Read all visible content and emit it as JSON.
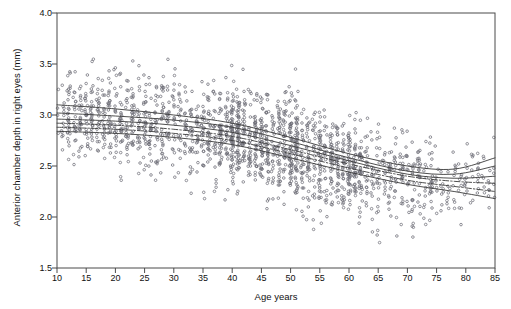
{
  "chart_data": {
    "type": "scatter",
    "title": "",
    "xlabel": "Age years",
    "ylabel": "Anterior chamber depth in right eyes (mm)",
    "xlim": [
      10,
      85
    ],
    "ylim": [
      1.5,
      4.0
    ],
    "xticks": [
      10,
      15,
      20,
      25,
      30,
      35,
      40,
      45,
      50,
      55,
      60,
      65,
      70,
      75,
      80,
      85
    ],
    "xtick_labels": [
      "10",
      "15",
      "20",
      "25",
      "30",
      "35",
      "40",
      "45",
      "50",
      "55",
      "60",
      "65",
      "70",
      "75",
      "80",
      "85"
    ],
    "yticks": [
      1.5,
      2.0,
      2.5,
      3.0,
      3.5,
      4.0
    ],
    "ytick_labels": [
      "1.5",
      "2.0",
      "2.5",
      "3.0",
      "3.5",
      "4.0"
    ],
    "grid": false,
    "legend": "none",
    "marker": "open-circle",
    "marker_size_px": 2.6,
    "marker_color": "#6f6f78",
    "point_count_approx": 1500,
    "series": [
      {
        "name": "Anterior chamber depth observations",
        "description": "Individual right-eye anterior chamber depth measurements plotted against age in whole years, producing vertical columns of points at each integer age.",
        "x_band_spacing": 1,
        "dense_age_columns": [
          40,
          41,
          45,
          50,
          51,
          55,
          60
        ],
        "trend_summary": [
          {
            "age": 10,
            "mean": 3.0,
            "sd": 0.22
          },
          {
            "age": 15,
            "mean": 2.98,
            "sd": 0.22
          },
          {
            "age": 20,
            "mean": 2.96,
            "sd": 0.22
          },
          {
            "age": 25,
            "mean": 2.93,
            "sd": 0.22
          },
          {
            "age": 30,
            "mean": 2.9,
            "sd": 0.23
          },
          {
            "age": 35,
            "mean": 2.86,
            "sd": 0.23
          },
          {
            "age": 40,
            "mean": 2.81,
            "sd": 0.24
          },
          {
            "age": 45,
            "mean": 2.74,
            "sd": 0.24
          },
          {
            "age": 50,
            "mean": 2.66,
            "sd": 0.24
          },
          {
            "age": 55,
            "mean": 2.58,
            "sd": 0.24
          },
          {
            "age": 60,
            "mean": 2.5,
            "sd": 0.23
          },
          {
            "age": 65,
            "mean": 2.43,
            "sd": 0.23
          },
          {
            "age": 70,
            "mean": 2.38,
            "sd": 0.22
          },
          {
            "age": 75,
            "mean": 2.34,
            "sd": 0.21
          },
          {
            "age": 80,
            "mean": 2.34,
            "sd": 0.2
          },
          {
            "age": 85,
            "mean": 2.36,
            "sd": 0.2
          }
        ],
        "y_range_observed": [
          1.55,
          3.58
        ]
      }
    ],
    "fitted_curves": [
      {
        "name": "upper percentile curve",
        "style": "solid",
        "points": [
          [
            10,
            3.1
          ],
          [
            20,
            3.06
          ],
          [
            30,
            3.0
          ],
          [
            40,
            2.92
          ],
          [
            50,
            2.78
          ],
          [
            60,
            2.62
          ],
          [
            70,
            2.5
          ],
          [
            78,
            2.47
          ],
          [
            85,
            2.58
          ]
        ]
      },
      {
        "name": "upper-middle curve",
        "style": "solid",
        "points": [
          [
            10,
            3.02
          ],
          [
            20,
            2.99
          ],
          [
            30,
            2.95
          ],
          [
            40,
            2.88
          ],
          [
            50,
            2.74
          ],
          [
            60,
            2.58
          ],
          [
            70,
            2.45
          ],
          [
            78,
            2.42
          ],
          [
            85,
            2.5
          ]
        ]
      },
      {
        "name": "median curve",
        "style": "solid",
        "points": [
          [
            10,
            2.96
          ],
          [
            20,
            2.94
          ],
          [
            30,
            2.9
          ],
          [
            40,
            2.83
          ],
          [
            50,
            2.7
          ],
          [
            60,
            2.55
          ],
          [
            70,
            2.42
          ],
          [
            78,
            2.38
          ],
          [
            85,
            2.4
          ]
        ]
      },
      {
        "name": "lower-middle dashed curve",
        "style": "dash-dot",
        "points": [
          [
            10,
            2.92
          ],
          [
            20,
            2.9
          ],
          [
            30,
            2.86
          ],
          [
            40,
            2.79
          ],
          [
            50,
            2.66
          ],
          [
            60,
            2.52
          ],
          [
            70,
            2.4
          ],
          [
            78,
            2.35
          ],
          [
            85,
            2.33
          ]
        ]
      },
      {
        "name": "lower dashed curve",
        "style": "dash-dot",
        "points": [
          [
            10,
            2.88
          ],
          [
            20,
            2.86
          ],
          [
            30,
            2.82
          ],
          [
            40,
            2.75
          ],
          [
            50,
            2.62
          ],
          [
            60,
            2.48
          ],
          [
            70,
            2.36
          ],
          [
            78,
            2.3
          ],
          [
            85,
            2.25
          ]
        ]
      },
      {
        "name": "lowest curve",
        "style": "solid",
        "points": [
          [
            10,
            2.84
          ],
          [
            20,
            2.82
          ],
          [
            30,
            2.78
          ],
          [
            40,
            2.71
          ],
          [
            50,
            2.58
          ],
          [
            60,
            2.44
          ],
          [
            70,
            2.32
          ],
          [
            78,
            2.25
          ],
          [
            85,
            2.18
          ]
        ]
      }
    ],
    "colors": {
      "axis": "#4a4a4a",
      "marker": "#6f6f78",
      "curve": "#3a3a3a",
      "background": "#ffffff"
    }
  },
  "header": {
    "cut_off_text": ""
  }
}
